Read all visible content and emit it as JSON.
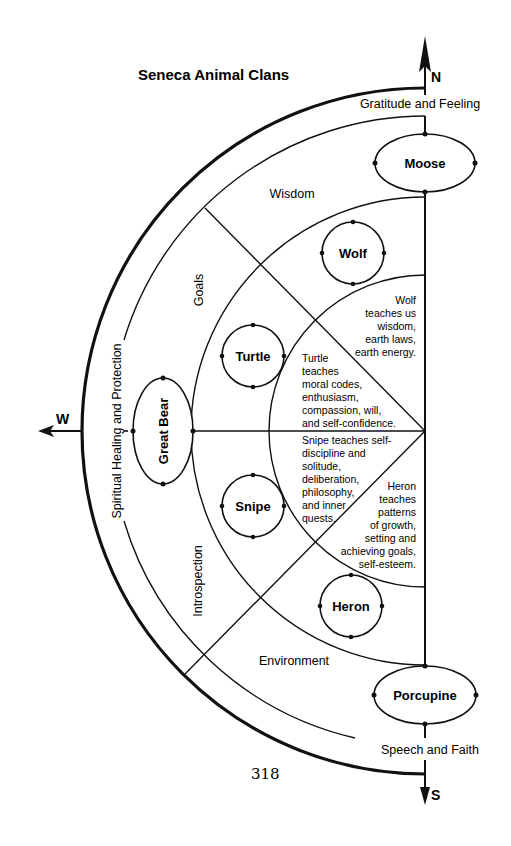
{
  "title": "Seneca Animal Clans",
  "directions": {
    "north": "N",
    "south": "S",
    "west": "W"
  },
  "outer_bands": {
    "north": "Gratitude and Feeling",
    "west": "Spiritual Healing and Protection",
    "south": "Speech and Faith"
  },
  "middle_themes": {
    "wisdom": "Wisdom",
    "goals": "Goals",
    "introspection": "Introspection",
    "environment": "Environment"
  },
  "clans": {
    "moose": "Moose",
    "great_bear": "Great Bear",
    "porcupine": "Porcupine",
    "wolf": "Wolf",
    "turtle": "Turtle",
    "snipe": "Snipe",
    "heron": "Heron"
  },
  "teachings": {
    "wolf": [
      "Wolf",
      "teaches us",
      "wisdom,",
      "earth laws,",
      "earth energy."
    ],
    "turtle": [
      "Turtle",
      "teaches",
      "moral codes,",
      "enthusiasm,",
      "compassion, will,",
      "and self-confidence."
    ],
    "snipe": [
      "Snipe teaches self-",
      "discipline and",
      "solitude,",
      "deliberation,",
      "philosophy,",
      "and inner",
      "quests."
    ],
    "heron": [
      "Heron",
      "teaches",
      "patterns",
      "of growth,",
      "setting and",
      "achieving goals,",
      "self-esteem."
    ]
  },
  "page_number": "318"
}
